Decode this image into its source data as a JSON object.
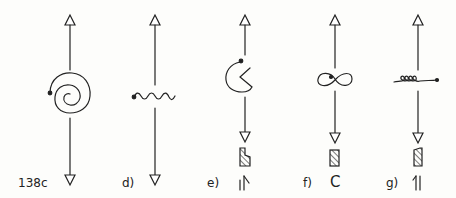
{
  "figure": {
    "panels": [
      {
        "id": "c",
        "label": "138c",
        "symbol": "spiral"
      },
      {
        "id": "d",
        "label": "d)",
        "symbol": "wave"
      },
      {
        "id": "e",
        "label": "e)",
        "symbol": "open-circle-notch",
        "extra": "hatched-block-with-double-arrow"
      },
      {
        "id": "f",
        "label": "f)",
        "symbol": "figure-eight",
        "extra": "hatched-block-with-C"
      },
      {
        "id": "g",
        "label": "g)",
        "symbol": "coil",
        "extra": "hatched-block-with-double-arrow"
      }
    ],
    "glyphs": {
      "f_bottom": "C"
    },
    "colors": {
      "ink": "#222222",
      "paper": "#fdfdfb"
    }
  }
}
